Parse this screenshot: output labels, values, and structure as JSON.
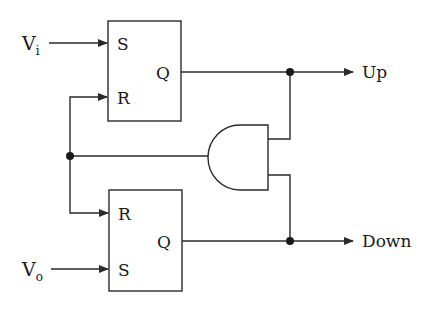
{
  "diagram": {
    "type": "circuit",
    "inputs": {
      "vi": {
        "main": "V",
        "sub": "i"
      },
      "vo": {
        "main": "V",
        "sub": "o"
      }
    },
    "flipflop_top": {
      "s": "S",
      "r": "R",
      "q": "Q"
    },
    "flipflop_bottom": {
      "r": "R",
      "s": "S",
      "q": "Q"
    },
    "gate": "AND",
    "outputs": {
      "up": "Up",
      "down": "Down"
    },
    "colors": {
      "stroke": "#2a2a2a",
      "background": "#ffffff"
    }
  }
}
